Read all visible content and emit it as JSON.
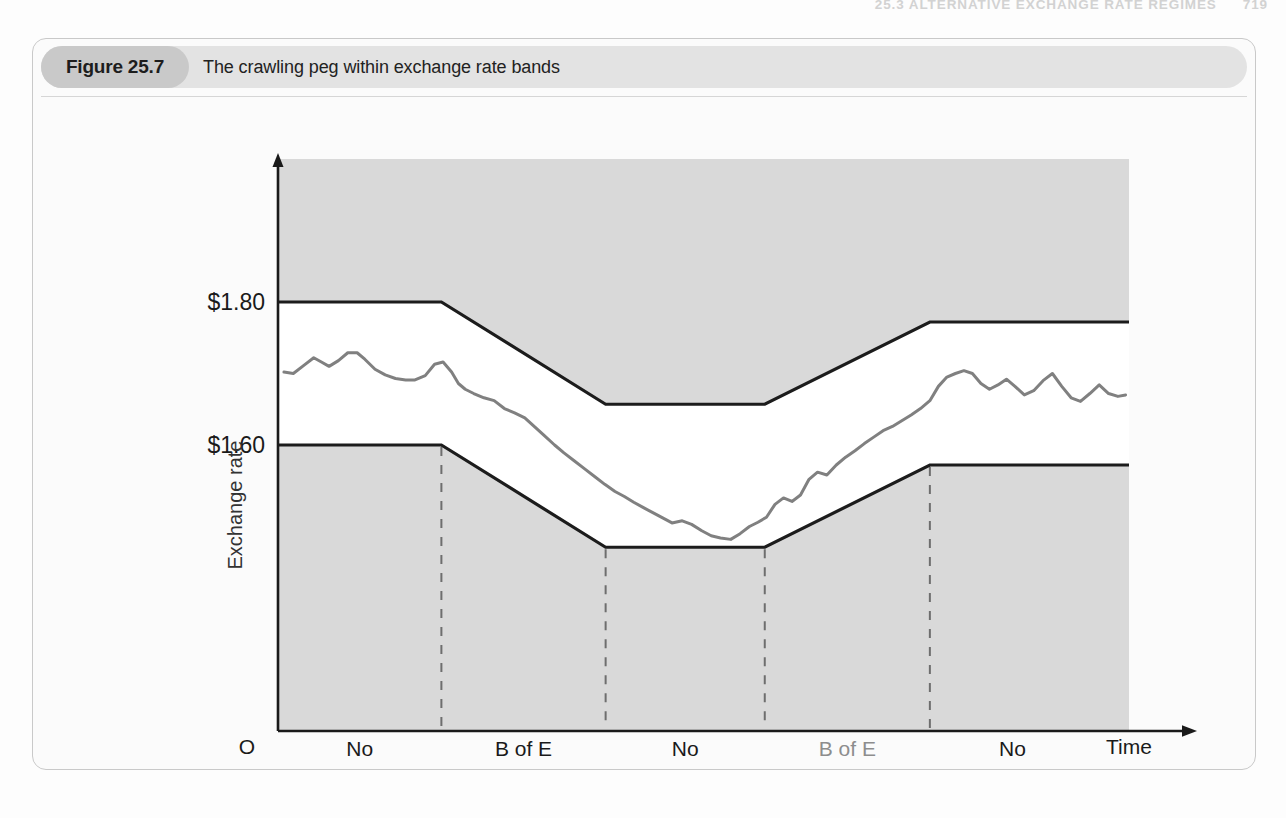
{
  "page_header": {
    "section": "25.3  ALTERNATIVE EXCHANGE RATE REGIMES",
    "page_number": "719"
  },
  "figure": {
    "number_label": "Figure 25.7",
    "caption": "The crawling peg within exchange rate bands"
  },
  "chart_data": {
    "type": "line",
    "title": "The crawling peg within exchange rate bands",
    "xlabel": "Time",
    "ylabel": "Exchange rate",
    "origin_label": "O",
    "ytick_labels": [
      "$1.80",
      "$1.60"
    ],
    "ytick_values": [
      1.8,
      1.6
    ],
    "xlim": [
      0,
      100
    ],
    "ylim": [
      1.2,
      2.0
    ],
    "grid": false,
    "legend": false,
    "phase_labels": [
      {
        "line1": "No",
        "line2": "intervention",
        "muted": false
      },
      {
        "line1": "B of E",
        "line2": "buys pounds",
        "muted": false
      },
      {
        "line1": "No",
        "line2": "intervention",
        "muted": false
      },
      {
        "line1": "B of E",
        "line2": "sells pounds",
        "muted": true
      },
      {
        "line1": "No",
        "line2": "intervention",
        "muted": false
      }
    ],
    "phase_boundaries_x": [
      19.2,
      38.5,
      57.2,
      76.6
    ],
    "series": [
      {
        "name": "Upper band limit",
        "style": "solid-black",
        "x": [
          0,
          19.2,
          38.5,
          57.2,
          76.6,
          100
        ],
        "y": [
          1.8,
          1.8,
          1.657,
          1.657,
          1.772,
          1.772
        ]
      },
      {
        "name": "Lower band limit",
        "style": "solid-black",
        "x": [
          0,
          19.2,
          38.5,
          57.2,
          76.6,
          100
        ],
        "y": [
          1.6,
          1.6,
          1.457,
          1.457,
          1.572,
          1.572
        ]
      },
      {
        "name": "Market exchange rate",
        "style": "solid-gray",
        "x": [
          0.7,
          1.8,
          3.0,
          4.2,
          5.1,
          6.0,
          7.1,
          8.2,
          9.3,
          10.2,
          11.4,
          12.6,
          13.8,
          15.0,
          16.1,
          17.3,
          18.4,
          19.4,
          20.4,
          21.2,
          22.0,
          23.0,
          24.2,
          25.4,
          26.6,
          27.8,
          29.0,
          30.2,
          31.3,
          32.5,
          33.6,
          34.8,
          36.0,
          37.2,
          38.4,
          39.6,
          40.7,
          41.8,
          43.0,
          44.1,
          45.2,
          46.3,
          47.5,
          48.6,
          49.8,
          50.9,
          52.0,
          53.2,
          54.3,
          55.4,
          56.4,
          57.4,
          58.4,
          59.4,
          60.4,
          61.4,
          62.4,
          63.4,
          64.5,
          65.6,
          66.7,
          67.8,
          68.9,
          70.0,
          71.1,
          72.2,
          73.3,
          74.4,
          75.5,
          76.6,
          77.6,
          78.6,
          79.6,
          80.6,
          81.6,
          82.6,
          83.6,
          84.6,
          85.6,
          86.6,
          87.7,
          88.8,
          89.9,
          91.0,
          92.1,
          93.2,
          94.3,
          95.4,
          96.5,
          97.6,
          98.7,
          99.6
        ],
        "y": [
          1.702,
          1.7,
          1.711,
          1.722,
          1.716,
          1.71,
          1.718,
          1.729,
          1.729,
          1.72,
          1.706,
          1.698,
          1.693,
          1.691,
          1.691,
          1.697,
          1.713,
          1.716,
          1.702,
          1.686,
          1.678,
          1.672,
          1.666,
          1.662,
          1.651,
          1.645,
          1.638,
          1.625,
          1.613,
          1.6,
          1.589,
          1.578,
          1.567,
          1.556,
          1.545,
          1.535,
          1.528,
          1.52,
          1.512,
          1.505,
          1.498,
          1.491,
          1.494,
          1.489,
          1.48,
          1.473,
          1.47,
          1.468,
          1.476,
          1.486,
          1.492,
          1.499,
          1.517,
          1.526,
          1.521,
          1.53,
          1.552,
          1.562,
          1.558,
          1.572,
          1.583,
          1.592,
          1.602,
          1.611,
          1.62,
          1.626,
          1.634,
          1.642,
          1.651,
          1.662,
          1.682,
          1.695,
          1.7,
          1.704,
          1.7,
          1.686,
          1.678,
          1.684,
          1.692,
          1.682,
          1.67,
          1.676,
          1.69,
          1.7,
          1.682,
          1.666,
          1.661,
          1.672,
          1.684,
          1.672,
          1.668,
          1.67
        ]
      }
    ]
  },
  "colors": {
    "plot_background": "#d9d9d9",
    "band_fill": "#ffffff",
    "band_line": "#1c1c1c",
    "rate_line": "#808080",
    "divider_line": "#6e6e6e",
    "chip_background": "#c9c9c9",
    "title_background": "#e3e3e3"
  }
}
